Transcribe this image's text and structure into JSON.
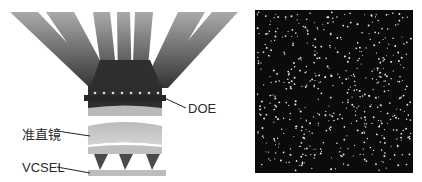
{
  "diagram": {
    "title": "",
    "left_panel": {
      "description": "Structured-light projector cross-section",
      "labels": {
        "doe": "DOE",
        "collimator": "准直镜",
        "vcsel": "VCSEL"
      },
      "components": [
        "diffracted-beams",
        "DOE",
        "collimator-lens",
        "VCSEL-emitters",
        "VCSEL-substrate"
      ],
      "beam_count": 7,
      "emitter_count": 3,
      "doe_dot_count": 8
    },
    "right_panel": {
      "description": "Projected pseudo-random dot pattern",
      "background": "#0b0b0b",
      "dot_color": "#e8e8e8"
    },
    "colors": {
      "beam_dark": "#3a3a3a",
      "beam_light": "#a8a8a8",
      "lens": "#c8c8c8",
      "substrate": "#bdbdbd"
    }
  }
}
